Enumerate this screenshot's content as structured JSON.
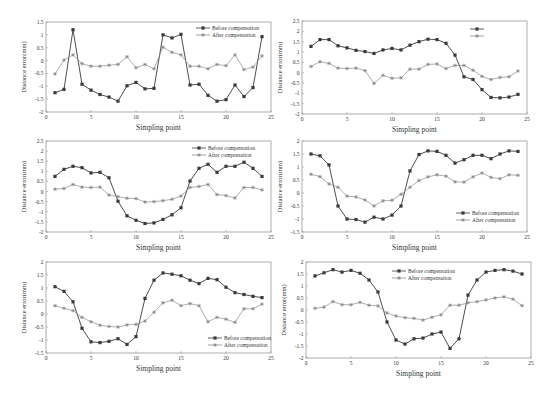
{
  "colors": {
    "before": "#3a3a3a",
    "after": "#8c8c8c",
    "axis": "#9a9a9a",
    "text": "#333333"
  },
  "chart_data": [
    {
      "type": "line",
      "xlabel": "Simpling point",
      "ylabel": "Distance error(mm)",
      "xlim": [
        0,
        25
      ],
      "ylim": [
        -2,
        1.5
      ],
      "xticks": [
        "0",
        "5",
        "10",
        "15",
        "20",
        "25"
      ],
      "yticks": [
        "-2",
        "-1.5",
        "-1",
        "-0.5",
        "0",
        "0.5",
        "1",
        "1.5"
      ],
      "legend_position": "top-right",
      "x": [
        1,
        2,
        3,
        4,
        5,
        6,
        7,
        8,
        9,
        10,
        11,
        12,
        13,
        14,
        15,
        16,
        17,
        18,
        19,
        20,
        21,
        22,
        23,
        24
      ],
      "series": [
        {
          "name": "Before compensation",
          "marker": "square",
          "values": [
            -1.25,
            -1.12,
            1.2,
            -0.92,
            -1.15,
            -1.32,
            -1.42,
            -1.58,
            -0.98,
            -0.85,
            -1.1,
            -1.08,
            1.0,
            0.88,
            1.02,
            -0.95,
            -0.92,
            -1.35,
            -1.58,
            -1.52,
            -0.95,
            -1.4,
            -1.05,
            0.93
          ]
        },
        {
          "name": "After compensation",
          "marker": "star",
          "values": [
            -0.52,
            0.02,
            0.22,
            -0.12,
            -0.22,
            -0.22,
            -0.18,
            -0.15,
            0.15,
            -0.28,
            -0.15,
            -0.32,
            0.52,
            0.32,
            0.22,
            -0.22,
            -0.22,
            -0.32,
            -0.15,
            -0.2,
            0.22,
            -0.35,
            -0.25,
            0.18
          ]
        }
      ]
    },
    {
      "type": "line",
      "xlabel": "Simpling point",
      "ylabel": "Distance error(mm)",
      "xlim": [
        0,
        25
      ],
      "ylim": [
        -2,
        2.5
      ],
      "xticks": [
        "0",
        "5",
        "10",
        "15",
        "20",
        "25"
      ],
      "yticks": [
        "-2",
        "-1.5",
        "-1",
        "-0.5",
        "0",
        "0.5",
        "1",
        "1.5",
        "2",
        "2.5"
      ],
      "legend_position": "top-right",
      "legend_labels_hidden": true,
      "x": [
        1,
        2,
        3,
        4,
        5,
        6,
        7,
        8,
        9,
        10,
        11,
        12,
        13,
        14,
        15,
        16,
        17,
        18,
        19,
        20,
        21,
        22,
        23,
        24
      ],
      "series": [
        {
          "name": "",
          "marker": "square",
          "values": [
            1.27,
            1.6,
            1.6,
            1.3,
            1.2,
            1.08,
            1.02,
            0.93,
            1.1,
            1.17,
            1.1,
            1.33,
            1.5,
            1.62,
            1.6,
            1.42,
            0.85,
            -0.2,
            -0.33,
            -0.82,
            -1.2,
            -1.22,
            -1.18,
            -1.05
          ]
        },
        {
          "name": "",
          "marker": "star",
          "values": [
            0.3,
            0.53,
            0.45,
            0.22,
            0.2,
            0.22,
            0.1,
            -0.52,
            -0.13,
            -0.27,
            -0.25,
            0.17,
            0.17,
            0.4,
            0.42,
            0.2,
            0.35,
            0.35,
            0.12,
            -0.18,
            -0.33,
            -0.23,
            -0.2,
            0.08
          ]
        }
      ]
    },
    {
      "type": "line",
      "xlabel": "Simpling point",
      "ylabel": "Distance error(mm)",
      "xlim": [
        0,
        25
      ],
      "ylim": [
        -2,
        2.5
      ],
      "xticks": [
        "0",
        "5",
        "10",
        "15",
        "20",
        "25"
      ],
      "yticks": [
        "-2",
        "-1.5",
        "-1",
        "-0.5",
        "0",
        "0.5",
        "1",
        "1.5",
        "2",
        "2.5"
      ],
      "legend_position": "top-right",
      "x": [
        1,
        2,
        3,
        4,
        5,
        6,
        7,
        8,
        9,
        10,
        11,
        12,
        13,
        14,
        15,
        16,
        17,
        18,
        19,
        20,
        21,
        22,
        23,
        24
      ],
      "series": [
        {
          "name": "Before compensation",
          "marker": "square",
          "values": [
            0.75,
            1.1,
            1.25,
            1.18,
            0.92,
            0.95,
            0.68,
            -0.48,
            -1.2,
            -1.42,
            -1.58,
            -1.55,
            -1.38,
            -1.15,
            -0.8,
            0.52,
            1.15,
            1.35,
            0.95,
            1.25,
            1.25,
            1.45,
            1.15,
            0.75
          ]
        },
        {
          "name": "After compensation",
          "marker": "star",
          "values": [
            0.12,
            0.15,
            0.35,
            0.22,
            0.2,
            0.22,
            -0.17,
            -0.25,
            -0.33,
            -0.35,
            -0.52,
            -0.5,
            -0.45,
            -0.38,
            -0.22,
            0.2,
            0.25,
            0.35,
            -0.15,
            -0.2,
            -0.32,
            0.2,
            0.2,
            0.08
          ]
        }
      ]
    },
    {
      "type": "line",
      "xlabel": "Simpling point",
      "ylabel": "Distance error(mm)",
      "xlim": [
        0,
        25
      ],
      "ylim": [
        -1.5,
        2
      ],
      "xticks": [
        "0",
        "5",
        "10",
        "15",
        "20",
        "25"
      ],
      "yticks": [
        "-1.5",
        "-1",
        "-0.5",
        "0",
        "0.5",
        "1",
        "1.5",
        "2"
      ],
      "legend_position": "bottom-right",
      "x": [
        1,
        2,
        3,
        4,
        5,
        6,
        7,
        8,
        9,
        10,
        11,
        12,
        13,
        14,
        15,
        16,
        17,
        18,
        19,
        20,
        21,
        22,
        23,
        24
      ],
      "series": [
        {
          "name": "Before compensation",
          "marker": "square",
          "values": [
            1.5,
            1.43,
            1.08,
            -0.5,
            -1.0,
            -1.02,
            -1.12,
            -0.93,
            -1.0,
            -0.85,
            -0.5,
            0.85,
            1.48,
            1.62,
            1.6,
            1.45,
            1.15,
            1.28,
            1.45,
            1.45,
            1.32,
            1.5,
            1.62,
            1.6
          ]
        },
        {
          "name": "After compensation",
          "marker": "star",
          "values": [
            0.72,
            0.63,
            0.35,
            0.22,
            -0.12,
            -0.15,
            -0.27,
            -0.5,
            -0.3,
            -0.28,
            -0.05,
            0.22,
            0.48,
            0.62,
            0.7,
            0.65,
            0.43,
            0.42,
            0.62,
            0.77,
            0.6,
            0.55,
            0.7,
            0.68
          ]
        }
      ]
    },
    {
      "type": "line",
      "xlabel": "Simpling point",
      "ylabel": "Distance error(mm)",
      "xlim": [
        0,
        25
      ],
      "ylim": [
        -1.5,
        2
      ],
      "xticks": [
        "0",
        "5",
        "10",
        "15",
        "20",
        "25"
      ],
      "yticks": [
        "-1.5",
        "-1",
        "-0.5",
        "0",
        "0.5",
        "1",
        "1.5",
        "2"
      ],
      "legend_position": "bottom-right",
      "x": [
        1,
        2,
        3,
        4,
        5,
        6,
        7,
        8,
        9,
        10,
        11,
        12,
        13,
        14,
        15,
        16,
        17,
        18,
        19,
        20,
        21,
        22,
        23,
        24
      ],
      "series": [
        {
          "name": "Before compensation",
          "marker": "square",
          "values": [
            1.05,
            0.87,
            0.47,
            -0.55,
            -1.07,
            -1.1,
            -1.05,
            -0.95,
            -1.17,
            -0.87,
            0.6,
            1.3,
            1.58,
            1.53,
            1.47,
            1.3,
            1.17,
            1.37,
            1.32,
            1.03,
            0.82,
            0.75,
            0.68,
            0.63
          ]
        },
        {
          "name": "After compensation",
          "marker": "star",
          "values": [
            0.32,
            0.22,
            0.13,
            -0.13,
            -0.3,
            -0.43,
            -0.48,
            -0.5,
            -0.42,
            -0.4,
            -0.27,
            0.07,
            0.43,
            0.53,
            0.32,
            0.4,
            0.32,
            -0.3,
            -0.13,
            -0.2,
            -0.32,
            0.2,
            0.2,
            0.38
          ]
        }
      ]
    },
    {
      "type": "line",
      "xlabel": "Simpling point",
      "ylabel": "Distance error(mm)",
      "xlim": [
        0,
        25
      ],
      "ylim": [
        -2,
        2
      ],
      "xticks": [
        "0",
        "5",
        "10",
        "15",
        "20",
        "25"
      ],
      "yticks": [
        "-2",
        "-1.5",
        "-1",
        "-0.5",
        "0",
        "0.5",
        "1",
        "1.5",
        "2"
      ],
      "legend_position": "top-center",
      "x": [
        1,
        2,
        3,
        4,
        5,
        6,
        7,
        8,
        9,
        10,
        11,
        12,
        13,
        14,
        15,
        16,
        17,
        18,
        19,
        20,
        21,
        22,
        23,
        24
      ],
      "series": [
        {
          "name": "Before compensation",
          "marker": "square",
          "values": [
            1.42,
            1.55,
            1.68,
            1.58,
            1.65,
            1.53,
            1.25,
            0.75,
            -0.5,
            -1.25,
            -1.42,
            -1.2,
            -1.17,
            -1.0,
            -0.92,
            -1.6,
            -1.2,
            0.62,
            1.25,
            1.58,
            1.65,
            1.68,
            1.62,
            1.5
          ]
        },
        {
          "name": "After compensation",
          "marker": "star",
          "values": [
            0.07,
            0.12,
            0.35,
            0.22,
            0.22,
            0.32,
            0.2,
            0.17,
            -0.12,
            -0.25,
            -0.32,
            -0.35,
            -0.42,
            -0.3,
            -0.2,
            0.2,
            0.2,
            0.3,
            0.35,
            0.42,
            0.5,
            0.55,
            0.45,
            0.18
          ]
        }
      ]
    }
  ]
}
